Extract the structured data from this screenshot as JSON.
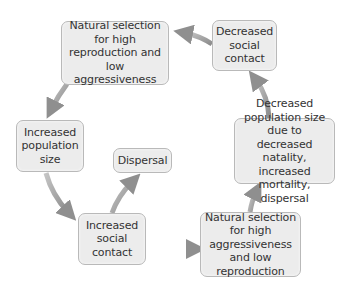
{
  "diagram": {
    "type": "cycle-flowchart",
    "colors": {
      "box_fill": "#ececec",
      "box_border": "#b9b9b9",
      "arrow": "#9a9a9a",
      "text": "#333333"
    },
    "nodes": [
      {
        "id": "n1",
        "text": "Natural selection for high reproduction and low aggressiveness"
      },
      {
        "id": "n2",
        "text": "Decreased social contact"
      },
      {
        "id": "n3",
        "text": "Increased population size"
      },
      {
        "id": "n4",
        "text": "Dispersal"
      },
      {
        "id": "n5",
        "text": "Increased social contact"
      },
      {
        "id": "n6",
        "text": "Decreased population size due to decreased natality, increased mortality, dispersal"
      },
      {
        "id": "n7",
        "text": "Natural selection for high aggressiveness and low reproduction"
      }
    ],
    "edges": [
      {
        "from": "n1",
        "to": "n3"
      },
      {
        "from": "n3",
        "to": "n5"
      },
      {
        "from": "n5",
        "to": "n4"
      },
      {
        "from": "n5",
        "to": "n7"
      },
      {
        "from": "n7",
        "to": "n6"
      },
      {
        "from": "n6",
        "to": "n2"
      },
      {
        "from": "n2",
        "to": "n1"
      }
    ]
  }
}
